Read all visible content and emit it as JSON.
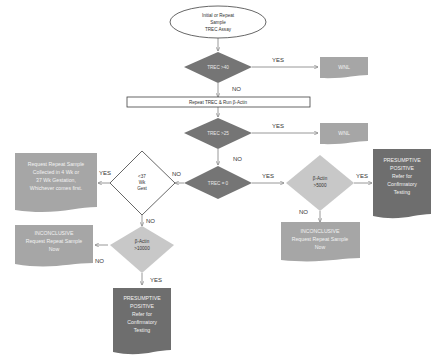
{
  "colors": {
    "dark_diamond": "#757575",
    "light_diamond": "#c8c8c8",
    "doc_gray": "#a6a6a6",
    "doc_dark": "#6e6e6e",
    "stroke": "#404040",
    "edge": "#7f7f7f"
  },
  "nodes": {
    "start": [
      "Initial  or Repeat",
      "Sample",
      "TREC Assay"
    ],
    "d_trec40": "TREC >40",
    "wnl1": "WNL",
    "repeat": "Repeat TREC  &  Run β-Actin",
    "d_trec25": "TREC >25",
    "wnl2": "WNL",
    "d_trec0": "TREC = 0",
    "d_gest": [
      "<37",
      "Wk",
      "Gest"
    ],
    "request_sample": [
      "Request Repeat Sample",
      "Collected in 4 Wk or",
      "37 Wk Gestation,",
      "Whichever comes first."
    ],
    "d_actin5000": [
      "β-Actin",
      ">5000"
    ],
    "presumptive_right": [
      "PRESUMPTIVE",
      "POSITIVE",
      "Refer for",
      "Confirmatory",
      "Testing"
    ],
    "inconclusive_right": [
      "INCONCLUSIVE",
      "Request Repeat Sample",
      "Now"
    ],
    "d_actin10000": [
      "β-Actin",
      ">10000"
    ],
    "inconclusive_left": [
      "INCONCLUSIVE",
      "Request Repeat Sample",
      "Now"
    ],
    "presumptive_bottom": [
      "PRESUMPTIVE",
      "POSITIVE",
      "Refer for",
      "Confirmatory",
      "Testing"
    ]
  },
  "edge_labels": {
    "trec40_yes": "YES",
    "trec40_no": "NO",
    "trec25_yes": "YES",
    "trec25_no": "NO",
    "trec0_yes": "YES",
    "trec0_no": "NO",
    "gest_yes": "YES",
    "gest_no": "NO",
    "actin5000_yes": "YES",
    "actin5000_no": "NO",
    "actin10000_no": "NO",
    "actin10000_yes": "YES"
  }
}
